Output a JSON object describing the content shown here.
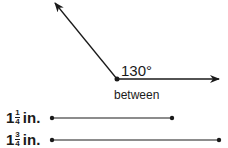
{
  "angle": {
    "measure_label": "130°",
    "caption": "between"
  },
  "segments": [
    {
      "whole": "1",
      "numerator": "1",
      "denominator": "4",
      "unit": "in."
    },
    {
      "whole": "1",
      "numerator": "3",
      "denominator": "4",
      "unit": "in."
    }
  ],
  "colors": {
    "ink": "#1a1a1a"
  }
}
